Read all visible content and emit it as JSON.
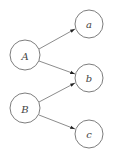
{
  "diagram": {
    "type": "directed-graph",
    "colors": {
      "node_stroke": "#6e6e6e",
      "edge": "#6e6e6e",
      "arrowhead": "#222222",
      "label": "#444444",
      "background": "#ffffff"
    },
    "nodes": [
      {
        "id": "A",
        "label": "A",
        "cx": 25,
        "cy": 55,
        "r": 15
      },
      {
        "id": "B",
        "label": "B",
        "cx": 25,
        "cy": 108,
        "r": 15
      },
      {
        "id": "a",
        "label": "a",
        "cx": 89,
        "cy": 24,
        "r": 14
      },
      {
        "id": "b",
        "label": "b",
        "cx": 89,
        "cy": 78,
        "r": 14
      },
      {
        "id": "c",
        "label": "c",
        "cx": 89,
        "cy": 134,
        "r": 14
      }
    ],
    "edges": [
      {
        "from": "A",
        "to": "a"
      },
      {
        "from": "A",
        "to": "b"
      },
      {
        "from": "B",
        "to": "b"
      },
      {
        "from": "B",
        "to": "c"
      }
    ]
  }
}
